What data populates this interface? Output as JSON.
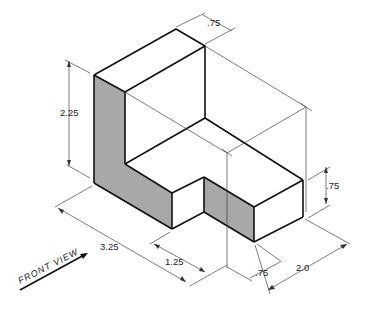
{
  "drawing": {
    "type": "isometric-view",
    "colors": {
      "object_line": "#111111",
      "dimension_line": "#333333",
      "shaded_face": "#a8a8a8",
      "background": "#ffffff"
    },
    "dimensions": {
      "height": "2.25",
      "top_thickness": ".75",
      "step_height": ".75",
      "overall_length": "3.25",
      "notch_width": "1.25",
      "notch_depth": ".75",
      "depth": "2.0"
    },
    "view_label": "FRONT VIEW"
  }
}
